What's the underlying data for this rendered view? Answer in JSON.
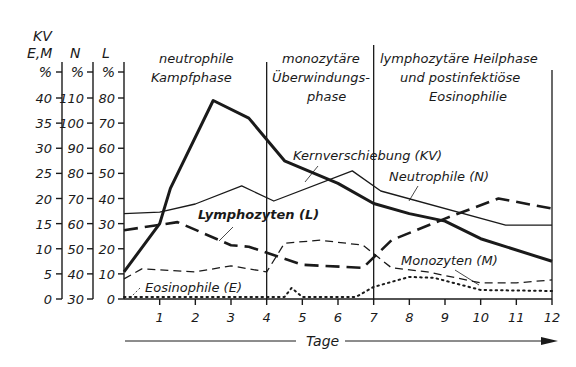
{
  "chart_data": {
    "type": "line",
    "title": "",
    "xlabel": "Tage",
    "x_ticks": [
      1,
      2,
      3,
      4,
      5,
      6,
      7,
      8,
      9,
      10,
      11,
      12
    ],
    "xlim": [
      0,
      12
    ],
    "y_axes": [
      {
        "id": "kvem",
        "header": [
          "KV",
          "E,M"
        ],
        "unit": "%",
        "ticks": [
          0,
          5,
          10,
          15,
          20,
          25,
          30,
          35,
          40
        ],
        "range": [
          0,
          40
        ]
      },
      {
        "id": "n",
        "header": [
          "N"
        ],
        "unit": "%",
        "ticks": [
          30,
          40,
          50,
          60,
          70,
          80,
          90,
          100,
          110
        ],
        "range": [
          30,
          110
        ]
      },
      {
        "id": "l",
        "header": [
          "L"
        ],
        "unit": "%",
        "ticks": [
          0,
          10,
          20,
          30,
          40,
          50,
          60,
          70,
          80
        ],
        "range": [
          0,
          80
        ]
      }
    ],
    "phases": [
      {
        "label_lines": [
          "neutrophile",
          "Kampfphase"
        ],
        "x_start": 0,
        "x_end": 4
      },
      {
        "label_lines": [
          "monozytäre",
          "Überwindungs-",
          "phase"
        ],
        "x_start": 4,
        "x_end": 7
      },
      {
        "label_lines": [
          "lymphozytäre Heilphase",
          "und postinfektiöse",
          "Eosinophilie"
        ],
        "x_start": 7,
        "x_end": 12
      }
    ],
    "phase_dividers": [
      4,
      7,
      12
    ],
    "series": [
      {
        "name": "Kernverschiebung (KV)",
        "axis": "kvem",
        "style": "thick-solid",
        "x": [
          0,
          1,
          1.3,
          2.5,
          3.5,
          4.5,
          6,
          7,
          8,
          9,
          10,
          12
        ],
        "values": [
          5.4,
          15,
          22,
          39.5,
          36,
          27.5,
          23,
          19,
          17,
          15.5,
          12,
          7.5
        ]
      },
      {
        "name": "Neutrophile (N)",
        "axis": "kvem",
        "style": "thin-solid",
        "x": [
          0,
          1,
          2,
          3.3,
          4.2,
          6.4,
          7.2,
          10.7,
          12
        ],
        "values": [
          17,
          17.3,
          18.9,
          22.5,
          19.5,
          25.5,
          21.5,
          14.7,
          14.7
        ],
        "values_native_axis_n": [
          64,
          64.5,
          67,
          72,
          69,
          80,
          72,
          59,
          59
        ]
      },
      {
        "name": "Lymphozyten (L)",
        "axis": "kvem",
        "style": "thick-dashed",
        "x": [
          0,
          1.5,
          3,
          3.5,
          5,
          6.7,
          7.5,
          9,
          10.5,
          12
        ],
        "values": [
          13.7,
          15.3,
          10.7,
          10.4,
          6.8,
          6.2,
          11.7,
          16,
          20,
          18
        ],
        "values_native_axis_l": [
          27.5,
          30.5,
          21.5,
          21,
          13.5,
          12.5,
          23.5,
          32,
          40,
          36
        ]
      },
      {
        "name": "Monozyten (M)",
        "axis": "kvem",
        "style": "thin-dashed",
        "x": [
          0,
          0.5,
          2,
          3,
          4,
          4.5,
          5.5,
          6.7,
          7.5,
          8.5,
          10,
          11,
          12
        ],
        "values": [
          4,
          6,
          5.4,
          6.6,
          5.4,
          11.1,
          11.7,
          10.7,
          6.2,
          5.4,
          3.2,
          3.2,
          3.8
        ]
      },
      {
        "name": "Eosinophile (E)",
        "axis": "kvem",
        "style": "dotted",
        "x": [
          0,
          4.5,
          4.7,
          5,
          6.5,
          7,
          8,
          8.7,
          10,
          12
        ],
        "values": [
          0.4,
          0.4,
          2.2,
          0.4,
          0.4,
          2.4,
          4.4,
          4.2,
          1.8,
          1.6
        ]
      }
    ],
    "annotations": [
      {
        "text": "Kernverschiebung (KV)",
        "points_to": "Kernverschiebung (KV)"
      },
      {
        "text": "Neutrophile (N)",
        "points_to": "Neutrophile (N)"
      },
      {
        "text": "Lymphozyten (L)",
        "points_to": "Lymphozyten (L)"
      },
      {
        "text": "Monozyten (M)",
        "points_to": "Monozyten (M)"
      },
      {
        "text": "Eosinophile (E)",
        "points_to": "Eosinophile (E)"
      }
    ],
    "grid": false,
    "legend": "inline labels"
  },
  "labels": {
    "axis_kv": "KV",
    "axis_em": "E,M",
    "axis_n": "N",
    "axis_l": "L",
    "pct": "%",
    "tage": "Tage",
    "phase1_l1": "neutrophile",
    "phase1_l2": "Kampfphase",
    "phase2_l1": "monozytäre",
    "phase2_l2": "Überwindungs-",
    "phase2_l3": "phase",
    "phase3_l1": "lymphozytäre Heilphase",
    "phase3_l2": "und postinfektiöse",
    "phase3_l3": "Eosinophilie",
    "kv_label": "Kernverschiebung (KV)",
    "n_label": "Neutrophile (N)",
    "l_label": "Lymphozyten (L)",
    "m_label": "Monozyten (M)",
    "e_label": "Eosinophile (E)"
  },
  "colors": {
    "ink": "#1a1a1a",
    "background": "#ffffff"
  }
}
